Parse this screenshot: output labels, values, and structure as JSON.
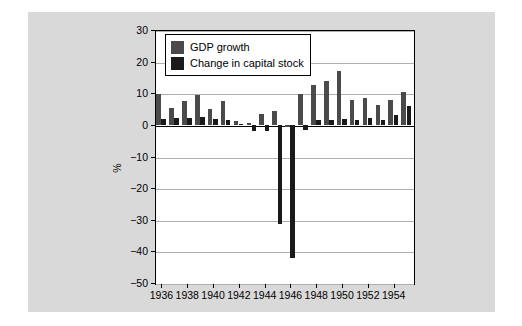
{
  "chart_data": {
    "type": "bar",
    "title": "",
    "subtitle": "",
    "xlabel": "",
    "ylabel": "%",
    "ylim": [
      -50,
      30
    ],
    "yticks": [
      30,
      20,
      10,
      0,
      -10,
      -20,
      -30,
      -40,
      -50
    ],
    "ytick_labels": [
      "30",
      "20",
      "10",
      "0",
      "−10",
      "−20",
      "−30",
      "−40",
      "−50"
    ],
    "grid": true,
    "grid_axis": "y",
    "legend_position": "top-left",
    "x": [
      1936,
      1937,
      1938,
      1939,
      1940,
      1941,
      1942,
      1943,
      1944,
      1945,
      1946,
      1947,
      1948,
      1949,
      1950,
      1951,
      1952,
      1953,
      1954,
      1955
    ],
    "categories": [
      "1936",
      "1937",
      "1938",
      "1939",
      "1940",
      "1941",
      "1942",
      "1943",
      "1944",
      "1945",
      "1946",
      "1947",
      "1948",
      "1949",
      "1950",
      "1951",
      "1952",
      "1953",
      "1954",
      "1955"
    ],
    "xtick_labels": [
      "1936",
      "1938",
      "1940",
      "1942",
      "1944",
      "1946",
      "1948",
      "1950",
      "1952",
      "1954"
    ],
    "xticks": [
      1936,
      1938,
      1940,
      1942,
      1944,
      1946,
      1948,
      1950,
      1952,
      1954
    ],
    "series": [
      {
        "name": "GDP growth",
        "color": "#4a4a4a",
        "values": [
          9.8,
          5.3,
          7.7,
          9.3,
          5.0,
          7.4,
          1.2,
          0.5,
          3.3,
          4.4,
          -0.8,
          9.7,
          12.5,
          14.0,
          17.0,
          8.0,
          8.5,
          6.2,
          7.8,
          10.5
        ]
      },
      {
        "name": "Change in capital stock",
        "color": "#1a1a1a",
        "values": [
          2.0,
          2.3,
          2.2,
          2.4,
          1.7,
          1.5,
          0.4,
          -1.8,
          -2.0,
          -31.5,
          -42.0,
          -1.5,
          1.6,
          1.4,
          2.0,
          1.5,
          2.2,
          1.6,
          3.2,
          6.0
        ]
      }
    ]
  },
  "legend": {
    "items": [
      {
        "label": "GDP growth",
        "color": "#4a4a4a"
      },
      {
        "label": "Change in capital stock",
        "color": "#1a1a1a"
      }
    ]
  },
  "figure": {
    "background": "#d9d9d9",
    "plot_background": "#ffffff",
    "axis_color": "#000000",
    "grid_color": "#b0b0b0"
  }
}
